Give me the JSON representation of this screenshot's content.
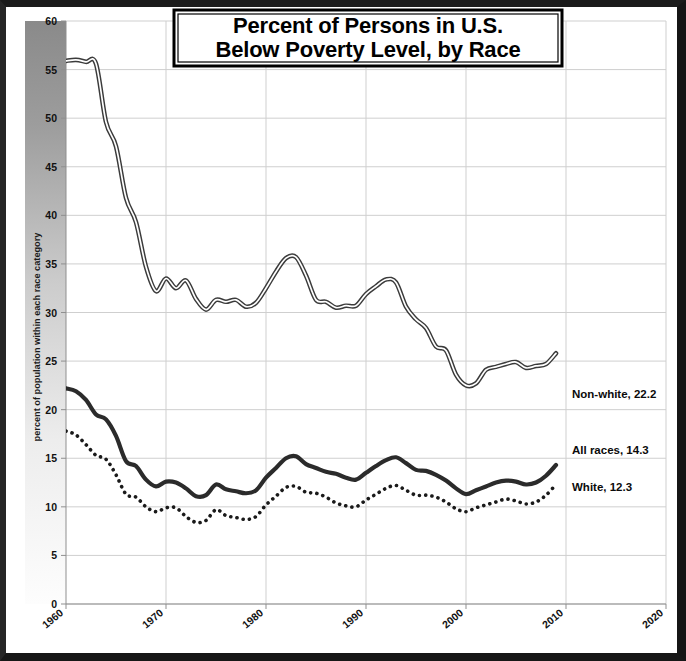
{
  "chart_data": {
    "type": "line",
    "title": "Percent of Persons in U.S.\nBelow Poverty Level, by Race",
    "title_line1": "Percent of Persons in U.S.",
    "title_line2": "Below Poverty Level, by Race",
    "xlabel": "",
    "ylabel": "percent of population within each race category",
    "xlim": [
      1960,
      2020
    ],
    "ylim": [
      0,
      60
    ],
    "xticks": [
      1960,
      1970,
      1980,
      1990,
      2000,
      2010,
      2020
    ],
    "yticks": [
      0,
      5,
      10,
      15,
      20,
      25,
      30,
      35,
      40,
      45,
      50,
      55,
      60
    ],
    "grid": true,
    "legend_position": "right-inline-annotations",
    "x": [
      1960,
      1961,
      1962,
      1963,
      1964,
      1965,
      1966,
      1967,
      1968,
      1969,
      1970,
      1971,
      1972,
      1973,
      1974,
      1975,
      1976,
      1977,
      1978,
      1979,
      1980,
      1981,
      1982,
      1983,
      1984,
      1985,
      1986,
      1987,
      1988,
      1989,
      1990,
      1991,
      1992,
      1993,
      1994,
      1995,
      1996,
      1997,
      1998,
      1999,
      2000,
      2001,
      2002,
      2003,
      2004,
      2005,
      2006,
      2007,
      2008,
      2009
    ],
    "series": [
      {
        "name": "Non-white",
        "end_label": "Non-white, 22.2",
        "end_value": 22.2,
        "style": "outlined-double-line",
        "color": "#3b3b3b",
        "values": [
          55.9,
          56.0,
          55.8,
          55.6,
          49.6,
          47.1,
          41.8,
          39.3,
          34.7,
          32.2,
          33.5,
          32.5,
          33.3,
          31.4,
          30.3,
          31.3,
          31.1,
          31.3,
          30.6,
          31.0,
          32.5,
          34.2,
          35.6,
          35.7,
          33.8,
          31.3,
          31.1,
          30.5,
          30.7,
          30.7,
          31.9,
          32.7,
          33.4,
          33.1,
          30.6,
          29.3,
          28.4,
          26.5,
          26.1,
          23.6,
          22.5,
          22.7,
          24.1,
          24.4,
          24.7,
          24.9,
          24.3,
          24.5,
          24.7,
          25.8
        ]
      },
      {
        "name": "All races",
        "end_label": "All races, 14.3",
        "end_value": 14.3,
        "style": "thick-solid",
        "color": "#2b2b2b",
        "values": [
          22.2,
          21.9,
          21.0,
          19.5,
          19.0,
          17.3,
          14.7,
          14.2,
          12.8,
          12.1,
          12.6,
          12.5,
          11.9,
          11.1,
          11.2,
          12.3,
          11.8,
          11.6,
          11.4,
          11.7,
          13.0,
          14.0,
          15.0,
          15.2,
          14.4,
          14.0,
          13.6,
          13.4,
          13.0,
          12.8,
          13.5,
          14.2,
          14.8,
          15.1,
          14.5,
          13.8,
          13.7,
          13.3,
          12.7,
          11.9,
          11.3,
          11.7,
          12.1,
          12.5,
          12.7,
          12.6,
          12.3,
          12.5,
          13.2,
          14.3
        ]
      },
      {
        "name": "White",
        "end_label": "White, 12.3",
        "end_value": 12.3,
        "style": "dotted",
        "color": "#1a1a1a",
        "values": [
          17.8,
          17.4,
          16.4,
          15.3,
          14.9,
          13.3,
          11.3,
          11.0,
          10.0,
          9.5,
          9.9,
          9.9,
          9.0,
          8.4,
          8.6,
          9.7,
          9.1,
          8.9,
          8.7,
          9.0,
          10.2,
          11.1,
          12.0,
          12.1,
          11.5,
          11.4,
          11.0,
          10.4,
          10.1,
          10.0,
          10.7,
          11.3,
          11.9,
          12.2,
          11.7,
          11.2,
          11.2,
          11.0,
          10.5,
          9.8,
          9.5,
          9.9,
          10.2,
          10.5,
          10.8,
          10.6,
          10.3,
          10.5,
          11.2,
          12.3
        ]
      }
    ]
  },
  "icons": {
    "chart_frame": "chart-frame"
  }
}
